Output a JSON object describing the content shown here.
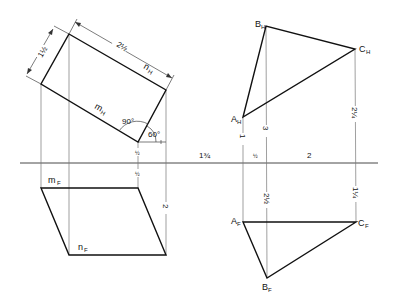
{
  "figure": {
    "type": "descriptive-geometry projection drawing",
    "ground_line": {
      "y": 163,
      "x1": 20,
      "x2": 378
    }
  },
  "left_view": {
    "top_view": {
      "shape": "rectangle",
      "corners": [
        [
          69,
          34
        ],
        [
          166,
          90
        ],
        [
          138,
          142
        ],
        [
          41,
          84
        ]
      ],
      "labels": {
        "n": {
          "text": "n",
          "sub": "H"
        },
        "m": {
          "text": "m",
          "sub": "H"
        }
      },
      "angle_right": "90°",
      "angle_inclination": "60°",
      "dim_long": "2½",
      "dim_short": "1½"
    },
    "front_view": {
      "shape": "parallelogram",
      "corners": [
        [
          41,
          188
        ],
        [
          138,
          188
        ],
        [
          166,
          255
        ],
        [
          69,
          255
        ]
      ],
      "labels": {
        "m": {
          "text": "m",
          "sub": "F"
        },
        "n": {
          "text": "n",
          "sub": "F"
        }
      },
      "dim_height": "2",
      "dim_above_gl": "½",
      "dim_below_gl": "½"
    }
  },
  "right_view": {
    "top_view": {
      "points": {
        "A": {
          "label": "A",
          "sub": "H",
          "x": 243,
          "y": 117
        },
        "B": {
          "label": "B",
          "sub": "H",
          "x": 266,
          "y": 26
        },
        "C": {
          "label": "C",
          "sub": "H",
          "x": 355,
          "y": 49
        }
      },
      "dims": {
        "a_to_gl": "1",
        "b_to_gl": "3",
        "c_to_gl": "2¼"
      }
    },
    "front_view": {
      "points": {
        "A": {
          "label": "A",
          "sub": "F",
          "x": 243,
          "y": 222
        },
        "B": {
          "label": "B",
          "sub": "F",
          "x": 267,
          "y": 278
        },
        "C": {
          "label": "C",
          "sub": "F",
          "x": 356,
          "y": 222
        }
      },
      "dims": {
        "b_to_gl": "2½",
        "c_to_gl": "1¼"
      }
    },
    "horizontal_dims": {
      "left_offset": "1¾",
      "a_to_b": "½",
      "b_to_c": "2"
    }
  }
}
